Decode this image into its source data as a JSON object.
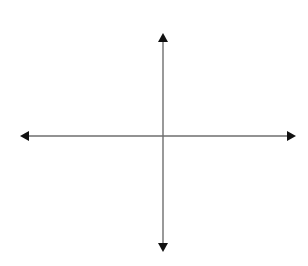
{
  "diagram": {
    "type": "coordinate-axes",
    "background": "#ffffff",
    "axis_color": "#6e6e6e",
    "arrow_color": "#111111",
    "origin": {
      "x": 163,
      "y": 136
    },
    "x_axis": {
      "y": 136,
      "x_start": 20,
      "x_end": 296,
      "arrows": [
        "left",
        "right"
      ]
    },
    "y_axis": {
      "x": 163,
      "y_start": 33,
      "y_end": 252,
      "arrows": [
        "up",
        "down"
      ]
    }
  }
}
